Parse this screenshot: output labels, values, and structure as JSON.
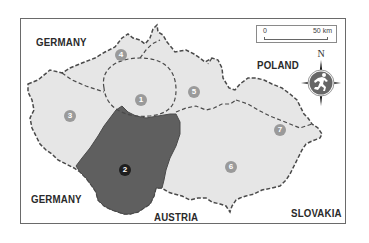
{
  "map": {
    "countries": {
      "germany_north": "GERMANY",
      "germany_south": "GERMANY",
      "poland": "POLAND",
      "austria": "AUSTRIA",
      "slovakia": "SLOVAKIA"
    },
    "regions": [
      {
        "id": "1",
        "label": "1",
        "highlighted": false
      },
      {
        "id": "2",
        "label": "2",
        "highlighted": true
      },
      {
        "id": "3",
        "label": "3",
        "highlighted": false
      },
      {
        "id": "4",
        "label": "4",
        "highlighted": false
      },
      {
        "id": "5",
        "label": "5",
        "highlighted": false
      },
      {
        "id": "6",
        "label": "6",
        "highlighted": false
      },
      {
        "id": "7",
        "label": "7",
        "highlighted": false
      }
    ],
    "scale": {
      "start": "0",
      "end": "50 km"
    },
    "compass": {
      "north_label": "N",
      "icon": "runner-compass-icon"
    },
    "colors": {
      "region_fill": "#e6e6e6",
      "highlight_fill": "#5f5f5f",
      "border": "#4a4a4a",
      "badge": "#9a9a9a",
      "highlight_badge": "#1e1e1e",
      "frame": "#6a6a6a"
    }
  }
}
